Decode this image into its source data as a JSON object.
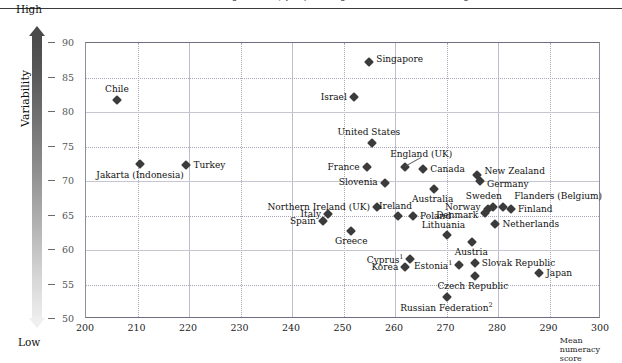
{
  "figure": {
    "title_cut": "mean numeracy scores, proficiency scores and variability",
    "y_axis_title": "Variability",
    "x_axis_title": "Mean numeracy score",
    "gradient_high_label": "High",
    "gradient_low_label": "Low",
    "accent_color": "#3b3b3b",
    "grid_color": "#a8a8bb"
  },
  "chart_data": {
    "type": "scatter",
    "title": "",
    "xlabel": "Mean numeracy score",
    "ylabel": "Variability",
    "xlim": [
      200,
      300
    ],
    "ylim": [
      50,
      90
    ],
    "xticks": [
      200,
      210,
      220,
      230,
      240,
      250,
      260,
      270,
      280,
      290,
      300
    ],
    "yticks": [
      50,
      55,
      60,
      65,
      70,
      75,
      80,
      85,
      90
    ],
    "grid": true,
    "legend": "none",
    "points": [
      {
        "label": "Chile",
        "x": 206.0,
        "y": 81.7,
        "lpos": "c",
        "ldx": 0,
        "ldy": -11
      },
      {
        "label": "Jakarta (Indonesia)",
        "x": 210.5,
        "y": 72.5,
        "lpos": "c",
        "ldx": 0,
        "ldy": 11
      },
      {
        "label": "Turkey",
        "x": 219.5,
        "y": 72.3,
        "lpos": "l",
        "ldx": 7,
        "ldy": 0
      },
      {
        "label": "Singapore",
        "x": 255.0,
        "y": 87.2,
        "lpos": "l",
        "ldx": 7,
        "ldy": -3
      },
      {
        "label": "Israel",
        "x": 252.0,
        "y": 82.2,
        "lpos": "r",
        "ldx": -7,
        "ldy": 0
      },
      {
        "label": "United States",
        "x": 255.5,
        "y": 75.5,
        "lpos": "c",
        "ldx": -3,
        "ldy": -11
      },
      {
        "label": "England (UK)",
        "x": 262.0,
        "y": 72.0,
        "lpos": "c",
        "ldx": 16,
        "ldy": -13,
        "leader": true
      },
      {
        "label": "France",
        "x": 254.5,
        "y": 72.0,
        "lpos": "r",
        "ldx": -7,
        "ldy": 0
      },
      {
        "label": "Canada",
        "x": 265.5,
        "y": 71.7,
        "lpos": "l",
        "ldx": 7,
        "ldy": 0
      },
      {
        "label": "New Zealand",
        "x": 276.0,
        "y": 70.8,
        "lpos": "l",
        "ldx": 7,
        "ldy": -4
      },
      {
        "label": "Germany",
        "x": 276.5,
        "y": 70.0,
        "lpos": "l",
        "ldx": 7,
        "ldy": 3
      },
      {
        "label": "Slovenia",
        "x": 258.0,
        "y": 69.7,
        "lpos": "r",
        "ldx": -7,
        "ldy": -1
      },
      {
        "label": "Australia",
        "x": 267.5,
        "y": 68.8,
        "lpos": "c",
        "ldx": -1,
        "ldy": 10
      },
      {
        "label": "Sweden",
        "x": 279.0,
        "y": 66.3,
        "lpos": "c",
        "ldx": -9,
        "ldy": -11
      },
      {
        "label": "Flanders (Belgium)",
        "x": 281.0,
        "y": 66.3,
        "lpos": "l",
        "ldx": 11,
        "ldy": -11
      },
      {
        "label": "Norway",
        "x": 278.0,
        "y": 66.0,
        "lpos": "r",
        "ldx": -7,
        "ldy": -2
      },
      {
        "label": "Finland",
        "x": 282.5,
        "y": 65.9,
        "lpos": "l",
        "ldx": 7,
        "ldy": 0
      },
      {
        "label": "Denmark",
        "x": 277.5,
        "y": 65.3,
        "lpos": "r",
        "ldx": -7,
        "ldy": 2
      },
      {
        "label": "Northern Ireland (UK)",
        "x": 256.5,
        "y": 66.2,
        "lpos": "r",
        "ldx": -7,
        "ldy": 0
      },
      {
        "label": "Ireland",
        "x": 260.5,
        "y": 65.0,
        "lpos": "c",
        "ldx": -2,
        "ldy": -10
      },
      {
        "label": "Italy",
        "x": 247.0,
        "y": 65.2,
        "lpos": "r",
        "ldx": -7,
        "ldy": 0
      },
      {
        "label": "Poland",
        "x": 263.5,
        "y": 64.9,
        "lpos": "l",
        "ldx": 7,
        "ldy": 0
      },
      {
        "label": "Netherlands",
        "x": 279.5,
        "y": 63.7,
        "lpos": "l",
        "ldx": 7,
        "ldy": 0
      },
      {
        "label": "Spain",
        "x": 246.0,
        "y": 64.2,
        "lpos": "r",
        "ldx": -7,
        "ldy": 0
      },
      {
        "label": "Greece",
        "x": 251.5,
        "y": 62.7,
        "lpos": "c",
        "ldx": 0,
        "ldy": 10
      },
      {
        "label": "Lithuania",
        "x": 270.0,
        "y": 62.2,
        "lpos": "c",
        "ldx": -3,
        "ldy": -10
      },
      {
        "label": "Austria",
        "x": 275.0,
        "y": 61.2,
        "lpos": "c",
        "ldx": -1,
        "ldy": 10
      },
      {
        "label": "Cyprus",
        "x": 263.0,
        "y": 58.7,
        "lpos": "r",
        "ldx": -7,
        "ldy": 0,
        "sup": "1"
      },
      {
        "label": "Slovak Republic",
        "x": 275.5,
        "y": 58.1,
        "lpos": "l",
        "ldx": 7,
        "ldy": 0
      },
      {
        "label": "Korea",
        "x": 262.0,
        "y": 57.6,
        "lpos": "r",
        "ldx": -7,
        "ldy": 0
      },
      {
        "label": "Estonia",
        "x": 272.5,
        "y": 57.8,
        "lpos": "r",
        "ldx": -7,
        "ldy": 0,
        "sup": "1"
      },
      {
        "label": "Japan",
        "x": 288.0,
        "y": 56.6,
        "lpos": "l",
        "ldx": 7,
        "ldy": 0
      },
      {
        "label": "Czech Republic",
        "x": 275.5,
        "y": 56.3,
        "lpos": "c",
        "ldx": -2,
        "ldy": 10
      },
      {
        "label": "Russian Federation",
        "x": 270.0,
        "y": 53.2,
        "lpos": "c",
        "ldx": 0,
        "ldy": 10,
        "sup": "2"
      }
    ]
  }
}
